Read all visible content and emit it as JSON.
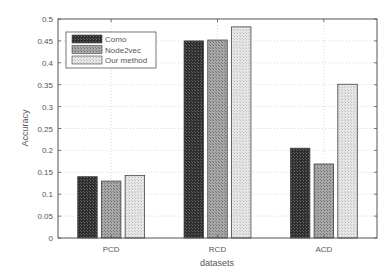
{
  "chart_data": {
    "type": "bar",
    "title": "",
    "xlabel": "datasets",
    "ylabel": "Accuracy",
    "categories": [
      "PCD",
      "RCD",
      "ACD"
    ],
    "series": [
      {
        "name": "Como",
        "values": [
          0.14,
          0.45,
          0.205
        ],
        "fill": "#3a3a3a",
        "pattern": "dark-checker"
      },
      {
        "name": "Node2vec",
        "values": [
          0.13,
          0.452,
          0.169
        ],
        "fill": "#9a9a9a",
        "pattern": "medium-checker"
      },
      {
        "name": "Our method",
        "values": [
          0.143,
          0.482,
          0.351
        ],
        "fill": "#dcdcdc",
        "pattern": "light-checker"
      }
    ],
    "ylim": [
      0,
      0.5
    ],
    "yticks": [
      0,
      0.05,
      0.1,
      0.15,
      0.2,
      0.25,
      0.3,
      0.35,
      0.4,
      0.45,
      0.5
    ],
    "ytick_labels": [
      "0",
      "0.05",
      "0.1",
      "0.15",
      "0.2",
      "0.25",
      "0.3",
      "0.35",
      "0.4",
      "0.45",
      "0.5"
    ],
    "grid": true,
    "grid_style": "dotted",
    "legend_position": "upper left"
  }
}
